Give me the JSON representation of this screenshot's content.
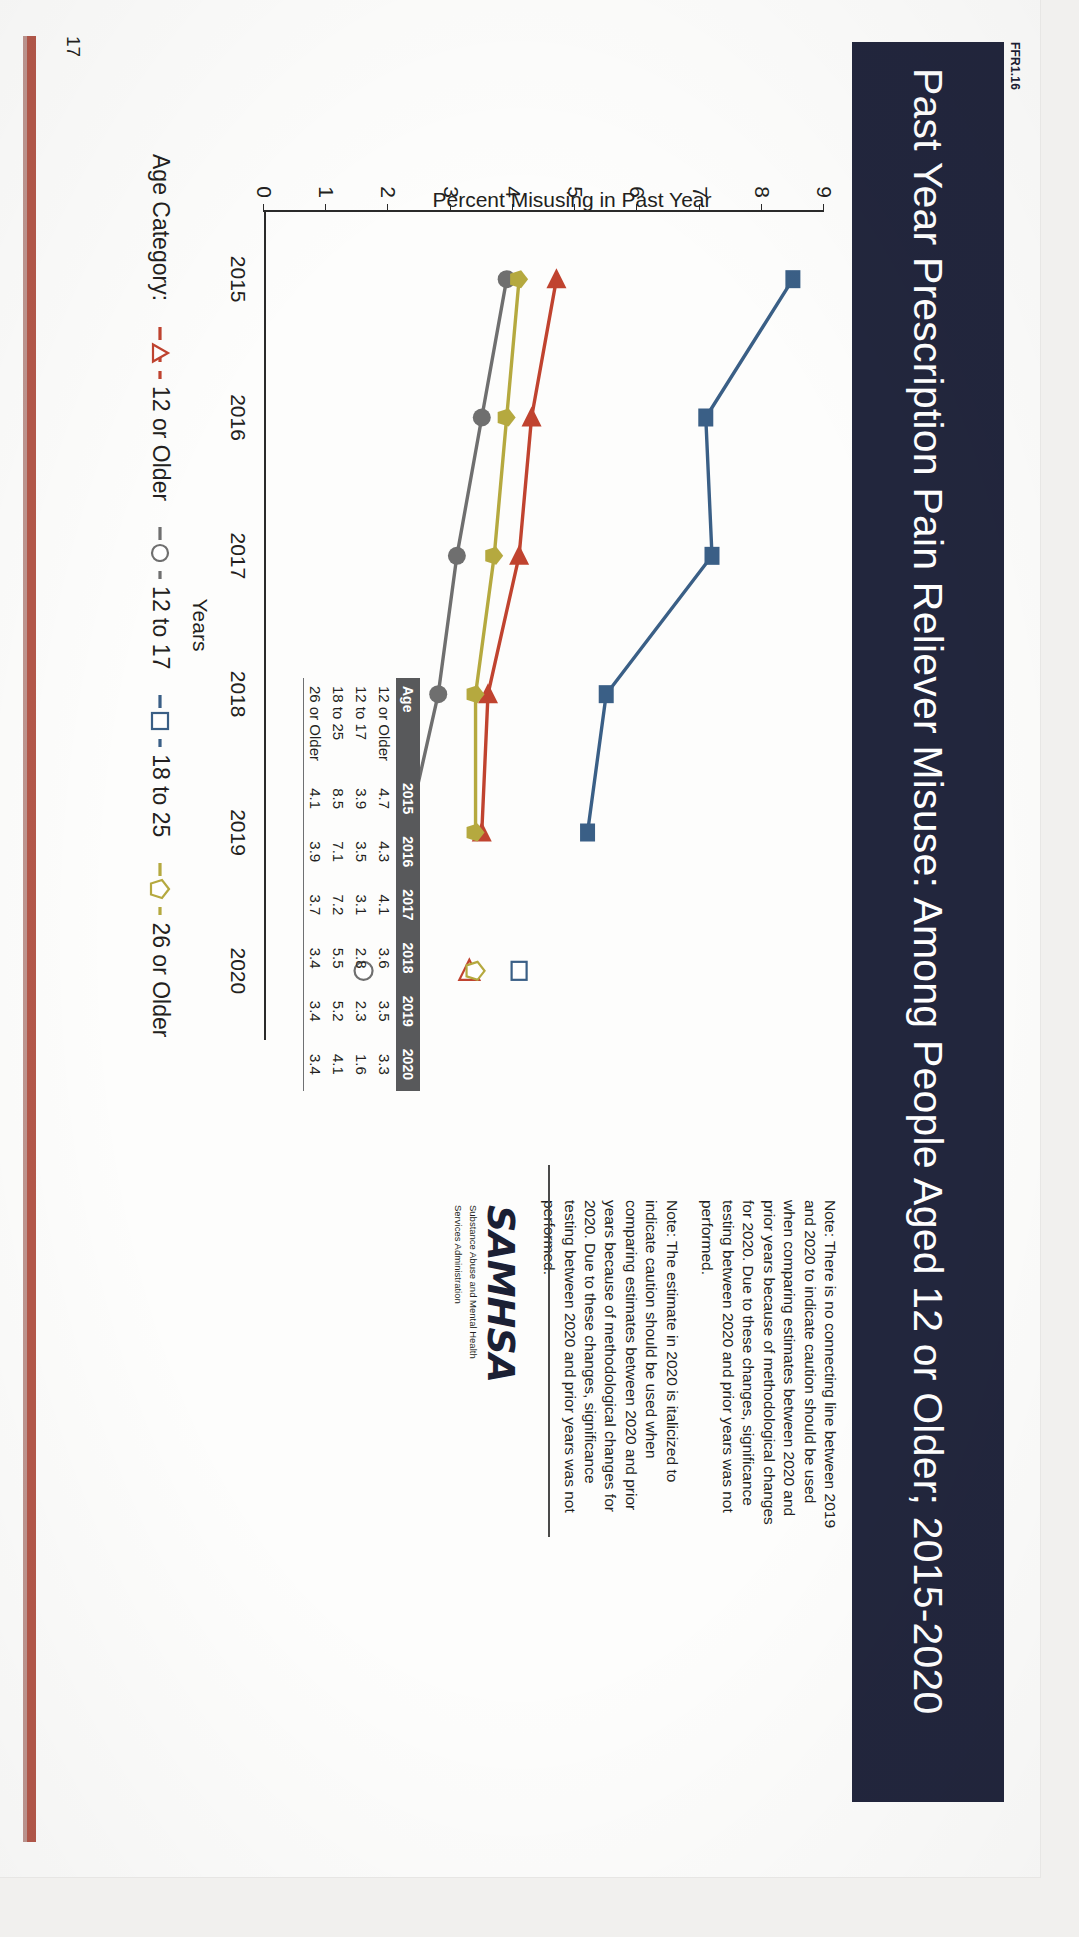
{
  "document": {
    "ffr_tag": "FFR1.16",
    "title": "Past Year Prescription Pain Reliever Misuse: Among People Aged 12 or Older; 2015-2020",
    "page_number": "17"
  },
  "chart_data": {
    "type": "line",
    "title": "Past Year Prescription Pain Reliever Misuse: Among People Aged 12 or Older; 2015-2020",
    "xlabel": "Years",
    "ylabel": "Percent Misusing in Past Year",
    "categories": [
      "2015",
      "2016",
      "2017",
      "2018",
      "2019",
      "2020"
    ],
    "ylim": [
      0,
      9
    ],
    "yticks": [
      "0",
      "1",
      "2",
      "3",
      "4",
      "5",
      "6",
      "7",
      "8",
      "9"
    ],
    "grid": false,
    "legend_label": "Age Category:",
    "legend_position": "below-plot",
    "series": [
      {
        "name": "12 or Older",
        "marker": "triangle",
        "color": "#c0432f",
        "values": [
          4.7,
          4.3,
          4.1,
          3.6,
          3.5,
          3.3
        ]
      },
      {
        "name": "12 to 17",
        "marker": "circle-open",
        "color": "#6f6f6f",
        "values": [
          3.9,
          3.5,
          3.1,
          2.8,
          2.3,
          1.6
        ]
      },
      {
        "name": "18 to 25",
        "marker": "square",
        "color": "#3a5f86",
        "values": [
          8.5,
          7.1,
          7.2,
          5.5,
          5.2,
          4.1
        ]
      },
      {
        "name": "26 or Older",
        "marker": "pentagon",
        "color": "#b5a93f",
        "values": [
          4.1,
          3.9,
          3.7,
          3.4,
          3.4,
          3.4
        ]
      }
    ],
    "break_between": [
      "2019",
      "2020"
    ],
    "table": {
      "columns": [
        "Age",
        "2015",
        "2016",
        "2017",
        "2018",
        "2019",
        "2020"
      ],
      "rows": [
        [
          "12 or Older",
          "4.7",
          "4.3",
          "4.1",
          "3.6",
          "3.5",
          "3.3"
        ],
        [
          "12 to 17",
          "3.9",
          "3.5",
          "3.1",
          "2.8",
          "2.3",
          "1.6"
        ],
        [
          "18 to 25",
          "8.5",
          "7.1",
          "7.2",
          "5.5",
          "5.2",
          "4.1"
        ],
        [
          "26 or Older",
          "4.1",
          "3.9",
          "3.7",
          "3.4",
          "3.4",
          "3.4"
        ]
      ]
    }
  },
  "notes": {
    "note1": "Note: There is no connecting line between 2019 and 2020 to indicate caution should be used when comparing estimates between 2020 and prior years because of methodological changes for 2020. Due to these changes, significance testing between 2020 and prior years was not performed.",
    "note2": "Note: The estimate in 2020 is italicized to indicate caution should be used when comparing estimates between 2020 and prior years because of methodological changes for 2020. Due to these changes, significance testing between 2020 and prior years was not performed."
  },
  "logo": {
    "wordmark": "SAMHSA",
    "line1": "Substance Abuse and Mental Health",
    "line2": "Services Administration"
  },
  "colors": {
    "header_bar": "#22263d",
    "accent_rule": "#b4584a",
    "table_header": "#58595b",
    "series_12_or_older": "#c0432f",
    "series_12_to_17": "#6f6f6f",
    "series_18_to_25": "#3a5f86",
    "series_26_or_older": "#b5a93f"
  }
}
